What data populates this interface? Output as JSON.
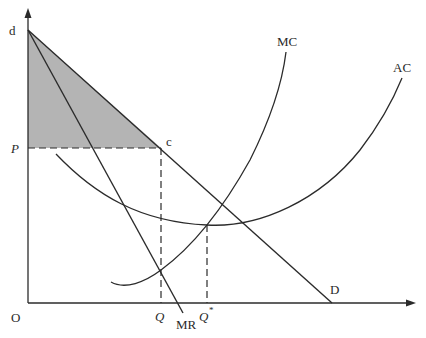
{
  "diagram": {
    "axes": {
      "origin_label": "O",
      "y_axis_arrow": true,
      "x_axis_arrow": true
    },
    "labels": {
      "d": "d",
      "c": "c",
      "P": "P",
      "MC": "MC",
      "AC": "AC",
      "D": "D",
      "MR": "MR",
      "Q": "Q",
      "Q_star": "Q",
      "Q_star_sup": "*",
      "O": "O"
    },
    "colors": {
      "line": "#2b2b2b",
      "shade": "#b4b4b4",
      "background": "#ffffff"
    },
    "curves": [
      {
        "name": "D",
        "type": "line",
        "from": [
          28,
          30
        ],
        "to": [
          332,
          303
        ]
      },
      {
        "name": "MR",
        "type": "line",
        "from": [
          28,
          30
        ],
        "to": [
          183,
          313
        ]
      },
      {
        "name": "MC",
        "type": "curve",
        "description": "U-shaped rising marginal cost curve"
      },
      {
        "name": "AC",
        "type": "curve",
        "description": "U-shaped average cost curve, minimum at Q*"
      }
    ],
    "points": {
      "d": [
        28,
        30
      ],
      "c": [
        161,
        148
      ],
      "P_level_y": 148,
      "Q_x": 161,
      "Q_star_x": 207
    },
    "shaded_region": "triangle d-P-c (consumer surplus)"
  }
}
